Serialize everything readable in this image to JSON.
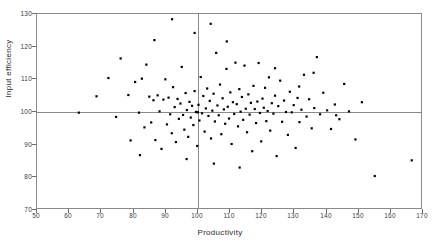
{
  "chart_data": {
    "type": "scatter",
    "title": "",
    "xlabel": "Productivity",
    "ylabel": "Input efficiency",
    "xlim": [
      50,
      170
    ],
    "ylim": [
      70,
      130
    ],
    "xticks": [
      50,
      60,
      70,
      80,
      90,
      100,
      110,
      120,
      130,
      140,
      150,
      160,
      170
    ],
    "yticks": [
      70,
      80,
      90,
      100,
      110,
      120,
      130
    ],
    "grid": false,
    "legend": null,
    "reference_lines": {
      "horizontal": 100,
      "vertical": 100,
      "color": "#8a8a8a"
    },
    "marker": {
      "shape": "square",
      "size_px": 2.2,
      "color": "#000000"
    },
    "points": [
      [
        68.5,
        104.8
      ],
      [
        72.2,
        110.4
      ],
      [
        74.6,
        98.5
      ],
      [
        76.0,
        116.4
      ],
      [
        78.4,
        105.2
      ],
      [
        79.1,
        91.3
      ],
      [
        80.5,
        109.2
      ],
      [
        81.7,
        99.8
      ],
      [
        82.6,
        110.2
      ],
      [
        83.4,
        95.3
      ],
      [
        84.0,
        114.5
      ],
      [
        84.9,
        104.7
      ],
      [
        85.5,
        96.8
      ],
      [
        86.2,
        103.6
      ],
      [
        86.8,
        91.4
      ],
      [
        87.5,
        105.1
      ],
      [
        88.1,
        100.2
      ],
      [
        88.7,
        88.7
      ],
      [
        89.3,
        103.8
      ],
      [
        89.9,
        110.0
      ],
      [
        90.4,
        96.2
      ],
      [
        90.9,
        104.4
      ],
      [
        91.4,
        99.3
      ],
      [
        91.9,
        93.5
      ],
      [
        92.3,
        107.6
      ],
      [
        92.8,
        101.5
      ],
      [
        93.2,
        90.8
      ],
      [
        93.7,
        104.0
      ],
      [
        94.1,
        97.9
      ],
      [
        94.6,
        102.6
      ],
      [
        95.0,
        113.8
      ],
      [
        95.4,
        99.1
      ],
      [
        95.8,
        94.6
      ],
      [
        96.2,
        105.8
      ],
      [
        96.6,
        100.6
      ],
      [
        97.0,
        92.4
      ],
      [
        97.4,
        103.1
      ],
      [
        97.8,
        98.3
      ],
      [
        98.2,
        101.9
      ],
      [
        98.6,
        96.0
      ],
      [
        99.0,
        106.4
      ],
      [
        99.4,
        100.0
      ],
      [
        99.8,
        89.6
      ],
      [
        100.2,
        102.2
      ],
      [
        100.5,
        97.4
      ],
      [
        100.9,
        110.7
      ],
      [
        101.3,
        99.6
      ],
      [
        101.7,
        104.9
      ],
      [
        102.1,
        94.0
      ],
      [
        102.5,
        101.1
      ],
      [
        102.9,
        107.2
      ],
      [
        103.3,
        98.8
      ],
      [
        103.7,
        103.4
      ],
      [
        104.1,
        91.9
      ],
      [
        104.5,
        100.4
      ],
      [
        104.9,
        105.6
      ],
      [
        105.3,
        97.1
      ],
      [
        105.7,
        118.1
      ],
      [
        106.1,
        102.0
      ],
      [
        106.5,
        99.0
      ],
      [
        106.9,
        108.4
      ],
      [
        107.3,
        93.2
      ],
      [
        107.7,
        104.2
      ],
      [
        108.1,
        100.8
      ],
      [
        108.5,
        96.4
      ],
      [
        108.9,
        113.2
      ],
      [
        109.3,
        101.6
      ],
      [
        109.7,
        98.0
      ],
      [
        110.1,
        106.0
      ],
      [
        110.5,
        90.2
      ],
      [
        110.9,
        103.0
      ],
      [
        111.3,
        99.4
      ],
      [
        111.7,
        115.1
      ],
      [
        112.1,
        102.4
      ],
      [
        112.5,
        95.6
      ],
      [
        112.9,
        107.0
      ],
      [
        113.3,
        100.1
      ],
      [
        113.7,
        104.6
      ],
      [
        114.1,
        97.6
      ],
      [
        114.5,
        114.2
      ],
      [
        114.9,
        101.0
      ],
      [
        115.3,
        93.8
      ],
      [
        115.7,
        105.4
      ],
      [
        116.1,
        99.2
      ],
      [
        116.5,
        102.8
      ],
      [
        116.9,
        88.0
      ],
      [
        117.3,
        108.0
      ],
      [
        117.7,
        100.9
      ],
      [
        118.1,
        96.6
      ],
      [
        118.5,
        103.2
      ],
      [
        118.9,
        115.0
      ],
      [
        119.3,
        99.7
      ],
      [
        119.7,
        91.0
      ],
      [
        120.1,
        104.1
      ],
      [
        120.5,
        101.3
      ],
      [
        120.9,
        107.4
      ],
      [
        121.3,
        97.2
      ],
      [
        121.7,
        100.3
      ],
      [
        122.1,
        110.6
      ],
      [
        122.5,
        94.3
      ],
      [
        123.0,
        102.7
      ],
      [
        123.5,
        99.5
      ],
      [
        124.0,
        105.0
      ],
      [
        124.5,
        86.5
      ],
      [
        125.0,
        101.8
      ],
      [
        125.6,
        109.6
      ],
      [
        126.2,
        97.0
      ],
      [
        126.8,
        103.5
      ],
      [
        127.4,
        100.0
      ],
      [
        128.0,
        93.0
      ],
      [
        128.6,
        106.2
      ],
      [
        129.2,
        99.9
      ],
      [
        129.8,
        102.1
      ],
      [
        130.4,
        89.0
      ],
      [
        131.0,
        104.3
      ],
      [
        131.6,
        96.9
      ],
      [
        132.2,
        100.7
      ],
      [
        133.0,
        111.4
      ],
      [
        133.8,
        98.6
      ],
      [
        134.6,
        103.9
      ],
      [
        135.4,
        95.0
      ],
      [
        136.2,
        101.2
      ],
      [
        137.0,
        116.8
      ],
      [
        138.0,
        99.3
      ],
      [
        139.0,
        105.9
      ],
      [
        140.2,
        100.5
      ],
      [
        141.4,
        94.8
      ],
      [
        142.6,
        102.3
      ],
      [
        144.0,
        97.8
      ],
      [
        145.5,
        108.6
      ],
      [
        147.0,
        100.2
      ],
      [
        149.0,
        91.6
      ],
      [
        151.0,
        103.0
      ],
      [
        155.0,
        80.4
      ],
      [
        166.5,
        85.2
      ],
      [
        63.0,
        99.8
      ],
      [
        86.5,
        122.0
      ],
      [
        92.0,
        128.4
      ],
      [
        99.0,
        124.2
      ],
      [
        104.0,
        127.0
      ],
      [
        109.0,
        121.6
      ],
      [
        99.6,
        100.0
      ],
      [
        100.0,
        99.9
      ],
      [
        82.0,
        86.8
      ],
      [
        96.5,
        85.6
      ],
      [
        105.0,
        84.2
      ],
      [
        113.0,
        83.0
      ],
      [
        124.0,
        113.4
      ],
      [
        131.5,
        107.8
      ],
      [
        136.0,
        112.0
      ],
      [
        143.0,
        99.0
      ]
    ]
  },
  "axes": {
    "x_tick_labels": [
      "50",
      "60",
      "70",
      "80",
      "90",
      "100",
      "110",
      "120",
      "130",
      "140",
      "150",
      "160",
      "170"
    ],
    "y_tick_labels": [
      "70",
      "80",
      "90",
      "100",
      "110",
      "120",
      "130"
    ],
    "x_title": "Productivity",
    "y_title": "Input efficiency"
  }
}
